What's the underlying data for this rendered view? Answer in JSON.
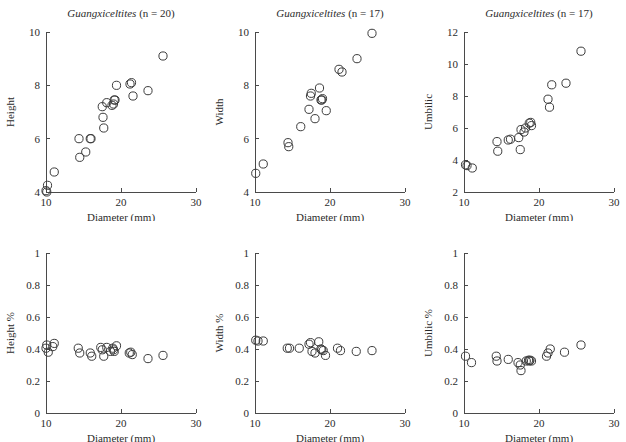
{
  "figure": {
    "background": "#ffffff",
    "marker_color": "#3c3c3c",
    "axis_color": "#4a4a4a",
    "rows": 2,
    "cols": 3
  },
  "chart_data": [
    {
      "id": "height-vs-diameter",
      "type": "scatter",
      "title_genus": "Guangxiceltites",
      "title_count": "(n = 20)",
      "xlabel": "Diameter (mm)",
      "ylabel": "Height",
      "xlim": [
        10,
        30
      ],
      "ylim": [
        4,
        10
      ],
      "xticks": [
        10,
        20,
        30
      ],
      "yticks": [
        4,
        6,
        8,
        10
      ],
      "grid": false,
      "legend": "none",
      "x": [
        10.0,
        10.1,
        10.2,
        11.1,
        14.4,
        14.5,
        15.3,
        15.9,
        16.0,
        17.5,
        17.6,
        17.7,
        18.1,
        18.8,
        19.0,
        19.1,
        19.2,
        19.4,
        21.2,
        21.4,
        21.6,
        23.6,
        25.6
      ],
      "y": [
        4.05,
        4.0,
        4.25,
        4.75,
        6.0,
        5.3,
        5.5,
        6.0,
        6.0,
        7.2,
        6.8,
        6.4,
        7.35,
        7.25,
        7.3,
        7.45,
        7.45,
        8.0,
        8.05,
        8.1,
        7.6,
        7.8,
        9.1
      ]
    },
    {
      "id": "width-vs-diameter",
      "type": "scatter",
      "title_genus": "Guangxiceltites",
      "title_count": "(n = 17)",
      "xlabel": "Diameter (mm)",
      "ylabel": "Width",
      "xlim": [
        10,
        30
      ],
      "ylim": [
        4,
        10
      ],
      "xticks": [
        10,
        20,
        30
      ],
      "yticks": [
        4,
        6,
        8,
        10
      ],
      "grid": false,
      "legend": "none",
      "x": [
        10.1,
        11.1,
        14.4,
        14.5,
        16.1,
        17.2,
        17.4,
        17.5,
        18.0,
        18.6,
        18.8,
        18.9,
        19.0,
        19.5,
        21.2,
        21.6,
        23.6,
        25.6
      ],
      "y": [
        4.7,
        5.05,
        5.85,
        5.7,
        6.45,
        7.1,
        7.6,
        7.7,
        6.75,
        7.9,
        7.45,
        7.45,
        7.5,
        7.05,
        8.6,
        8.5,
        9.0,
        9.95
      ]
    },
    {
      "id": "umbilic-vs-diameter",
      "type": "scatter",
      "title_genus": "Guangxiceltites",
      "title_count": "(n = 17)",
      "xlabel": "Diameter (mm)",
      "ylabel": "Umbilic",
      "xlim": [
        10,
        30
      ],
      "ylim": [
        2,
        12
      ],
      "xticks": [
        10,
        20,
        30
      ],
      "yticks": [
        2,
        4,
        6,
        8,
        10,
        12
      ],
      "grid": false,
      "legend": "none",
      "x": [
        10.2,
        10.4,
        11.1,
        14.4,
        14.5,
        15.9,
        16.2,
        17.3,
        17.5,
        17.6,
        18.0,
        18.2,
        18.7,
        18.9,
        19.0,
        21.2,
        21.4,
        21.7,
        23.6,
        25.6
      ],
      "y": [
        3.7,
        3.65,
        3.5,
        5.15,
        4.55,
        5.25,
        5.3,
        5.4,
        4.65,
        5.9,
        5.75,
        6.0,
        6.3,
        6.35,
        6.15,
        7.8,
        7.3,
        8.7,
        8.8,
        10.8
      ]
    },
    {
      "id": "height-pct-vs-diameter",
      "type": "scatter",
      "title_genus": "",
      "title_count": "",
      "xlabel": "Diameter (mm)",
      "ylabel": "Height %",
      "xlim": [
        10,
        30
      ],
      "ylim": [
        0,
        1
      ],
      "xticks": [
        10,
        20,
        30
      ],
      "yticks": [
        0,
        0.2,
        0.4,
        0.6,
        0.8,
        1
      ],
      "grid": false,
      "legend": "none",
      "x": [
        10.0,
        10.1,
        10.3,
        10.9,
        11.1,
        14.3,
        14.5,
        15.9,
        16.1,
        17.3,
        17.5,
        17.7,
        18.1,
        18.6,
        18.9,
        19.0,
        19.1,
        19.4,
        21.1,
        21.3,
        21.5,
        23.6,
        25.6
      ],
      "y": [
        0.405,
        0.425,
        0.38,
        0.415,
        0.435,
        0.405,
        0.375,
        0.375,
        0.355,
        0.41,
        0.395,
        0.355,
        0.41,
        0.385,
        0.405,
        0.395,
        0.385,
        0.42,
        0.375,
        0.38,
        0.365,
        0.34,
        0.36
      ]
    },
    {
      "id": "width-pct-vs-diameter",
      "type": "scatter",
      "title_genus": "",
      "title_count": "",
      "xlabel": "Diameter (mm)",
      "ylabel": "Width %",
      "xlim": [
        10,
        30
      ],
      "ylim": [
        0,
        1
      ],
      "xticks": [
        10,
        20,
        30
      ],
      "yticks": [
        0,
        0.2,
        0.4,
        0.6,
        0.8,
        1
      ],
      "grid": false,
      "legend": "none",
      "x": [
        10.1,
        10.4,
        11.1,
        14.3,
        14.6,
        15.9,
        17.2,
        17.4,
        17.6,
        18.0,
        18.5,
        18.8,
        18.9,
        19.1,
        19.4,
        21.0,
        21.4,
        23.5,
        25.6
      ],
      "y": [
        0.455,
        0.45,
        0.45,
        0.405,
        0.405,
        0.405,
        0.43,
        0.44,
        0.385,
        0.375,
        0.445,
        0.4,
        0.395,
        0.39,
        0.36,
        0.405,
        0.39,
        0.385,
        0.39
      ]
    },
    {
      "id": "umbilic-pct-vs-diameter",
      "type": "scatter",
      "title_genus": "",
      "title_count": "",
      "xlabel": "Diameter (mm)",
      "ylabel": "Umbilic %",
      "xlim": [
        10,
        30
      ],
      "ylim": [
        0,
        1
      ],
      "xticks": [
        10,
        20,
        30
      ],
      "yticks": [
        0,
        0.2,
        0.4,
        0.6,
        0.8,
        1
      ],
      "grid": false,
      "legend": "none",
      "x": [
        10.2,
        11.0,
        14.3,
        14.4,
        15.9,
        17.2,
        17.5,
        17.6,
        18.3,
        18.6,
        18.7,
        18.8,
        19.0,
        21.0,
        21.2,
        21.5,
        23.4,
        25.6
      ],
      "y": [
        0.355,
        0.315,
        0.355,
        0.325,
        0.335,
        0.315,
        0.3,
        0.265,
        0.325,
        0.33,
        0.325,
        0.33,
        0.325,
        0.355,
        0.375,
        0.4,
        0.38,
        0.425
      ]
    }
  ]
}
